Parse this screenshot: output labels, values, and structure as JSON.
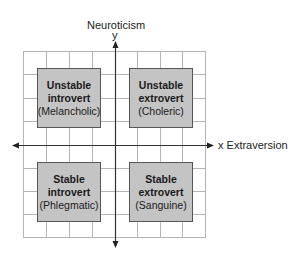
{
  "diagram": {
    "y_axis": {
      "name": "Neuroticism",
      "letter": "y"
    },
    "x_axis": {
      "name": "x Extraversion"
    },
    "quadrants": [
      {
        "position": "top-left",
        "line1": "Unstable",
        "line2": "introvert",
        "temperament": "(Melancholic)"
      },
      {
        "position": "top-right",
        "line1": "Unstable",
        "line2": "extrovert",
        "temperament": "(Choleric)"
      },
      {
        "position": "bottom-left",
        "line1": "Stable",
        "line2": "introvert",
        "temperament": "(Phlegmatic)"
      },
      {
        "position": "bottom-right",
        "line1": "Stable",
        "line2": "extrovert",
        "temperament": "(Sanguine)"
      }
    ],
    "colors": {
      "box_fill": "#c4c4c4",
      "grid": "#b0b0b0",
      "axis": "#333333"
    }
  }
}
